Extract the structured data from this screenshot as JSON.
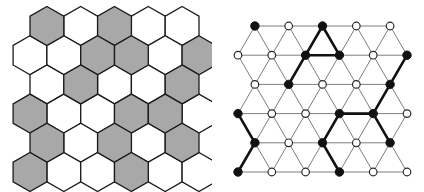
{
  "figure": {
    "background_color": "#ffffff",
    "panel_count": 2
  },
  "colors": {
    "shade_gray": "#a8a8a8",
    "cell_outline": "#1a1a1a",
    "thin_edge": "#7d7d7d",
    "bold_edge": "#111111",
    "vertex_filled": "#111111",
    "vertex_open": "#ffffff",
    "background": "#ffffff"
  },
  "left_panel": {
    "name": "hexagonal-tiling",
    "description": "Hexagon tiling with shaded and unshaded cells",
    "geometry": {
      "hex_radius": 19.5,
      "origin_x": 30,
      "origin_y": 26,
      "col_step": 33.8,
      "row_step": 29.2,
      "rows": 6
    },
    "rows": [
      {
        "index": 0,
        "offset": 1,
        "cells": [
          "shaded",
          "open",
          "shaded",
          "open",
          "open"
        ]
      },
      {
        "index": 1,
        "offset": 0,
        "cells": [
          "open",
          "open",
          "shaded",
          "shaded",
          "open",
          "shaded"
        ]
      },
      {
        "index": 2,
        "offset": 1,
        "cells": [
          "open",
          "shaded",
          "open",
          "open",
          "shaded"
        ]
      },
      {
        "index": 3,
        "offset": 0,
        "cells": [
          "shaded",
          "open",
          "open",
          "shaded",
          "shaded",
          "open"
        ]
      },
      {
        "index": 4,
        "offset": 1,
        "cells": [
          "shaded",
          "open",
          "shaded",
          "open",
          "shaded"
        ]
      },
      {
        "index": 5,
        "offset": 0,
        "cells": [
          "shaded",
          "open",
          "open",
          "shaded",
          "open",
          "open"
        ]
      }
    ]
  },
  "right_panel": {
    "name": "triangular-lattice",
    "description": "Dual triangular lattice with filled and open vertices and highlighted bold edges",
    "geometry": {
      "origin_x": 26,
      "origin_y": 26,
      "col_step": 33.8,
      "row_step": 29.2,
      "half_step": 16.9,
      "vertex_radius_filled": 4.2,
      "vertex_radius_open": 3.8,
      "rows": 6
    },
    "rows": [
      {
        "index": 0,
        "offset": 1,
        "vertices": [
          "filled",
          "open",
          "filled",
          "open",
          "open"
        ]
      },
      {
        "index": 1,
        "offset": 0,
        "vertices": [
          "open",
          "open",
          "filled",
          "filled",
          "open",
          "filled"
        ]
      },
      {
        "index": 2,
        "offset": 1,
        "vertices": [
          "open",
          "filled",
          "open",
          "open",
          "filled"
        ]
      },
      {
        "index": 3,
        "offset": 0,
        "vertices": [
          "filled",
          "open",
          "open",
          "filled",
          "filled",
          "open"
        ]
      },
      {
        "index": 4,
        "offset": 1,
        "vertices": [
          "filled",
          "open",
          "filled",
          "open",
          "filled"
        ]
      },
      {
        "index": 5,
        "offset": 0,
        "vertices": [
          "filled",
          "open",
          "open",
          "filled",
          "open",
          "open"
        ]
      }
    ]
  }
}
